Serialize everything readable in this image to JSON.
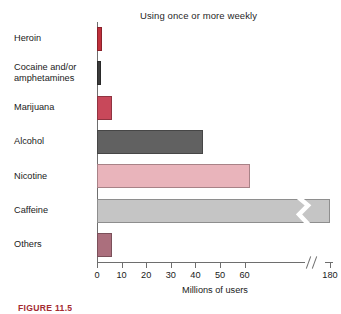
{
  "chart_data": {
    "type": "bar",
    "orientation": "horizontal",
    "title": "Using once or more weekly",
    "xlabel": "Millions of users",
    "ylabel": "",
    "xlim": [
      0,
      65
    ],
    "grid": false,
    "legend": null,
    "axis_break": {
      "present": true,
      "symbol": "//",
      "after_value": 60,
      "resumes_at": 180
    },
    "tick_labels": [
      "0",
      "10",
      "20",
      "30",
      "40",
      "50",
      "60",
      "180"
    ],
    "tick_values": [
      0,
      10,
      20,
      30,
      40,
      50,
      60,
      180
    ],
    "categories": [
      "Heroin",
      "Cocaine and/or\namphetamines",
      "Marijuana",
      "Alcohol",
      "Nicotine",
      "Caffeine",
      "Others"
    ],
    "values": [
      2,
      1.5,
      6,
      43,
      62,
      180,
      6
    ],
    "bar_colors": [
      "#c0303c",
      "#3b3b3b",
      "#c8485a",
      "#616161",
      "#e9b4bb",
      "#c5c5c5",
      "#ab6f7d"
    ]
  },
  "caption": {
    "text": "FIGURE 11.5"
  },
  "colors": {
    "axis": "#6e6e6e",
    "text": "#1a1a1a",
    "background": "#ffffff",
    "caption_accent": "#a32b31"
  }
}
